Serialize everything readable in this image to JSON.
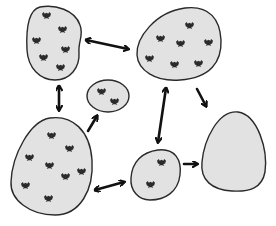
{
  "diagram": {
    "type": "metapopulation-patch-network",
    "colors": {
      "patch_fill": "#e2e2e2",
      "patch_stroke": "#2a2a2a",
      "arrow": "#111111",
      "bird": "#2b2b2b"
    },
    "patches": [
      {
        "id": "top-left",
        "bird_count": 6,
        "birds": [
          [
            46,
            15
          ],
          [
            62,
            29
          ],
          [
            36,
            40
          ],
          [
            65,
            49
          ],
          [
            43,
            57
          ],
          [
            60,
            67
          ]
        ]
      },
      {
        "id": "top-right",
        "bird_count": 7,
        "birds": [
          [
            189,
            25
          ],
          [
            160,
            38
          ],
          [
            180,
            43
          ],
          [
            208,
            42
          ],
          [
            149,
            58
          ],
          [
            174,
            64
          ],
          [
            198,
            63
          ]
        ]
      },
      {
        "id": "small-center",
        "bird_count": 2,
        "birds": [
          [
            101,
            91
          ],
          [
            114,
            101
          ]
        ]
      },
      {
        "id": "bottom-left",
        "bird_count": 8,
        "birds": [
          [
            51,
            135
          ],
          [
            69,
            148
          ],
          [
            29,
            157
          ],
          [
            49,
            165
          ],
          [
            81,
            171
          ],
          [
            65,
            176
          ],
          [
            25,
            185
          ],
          [
            48,
            198
          ]
        ]
      },
      {
        "id": "bottom-middle",
        "bird_count": 2,
        "birds": [
          [
            161,
            162
          ],
          [
            150,
            184
          ]
        ]
      },
      {
        "id": "bottom-right-empty",
        "bird_count": 0,
        "birds": []
      }
    ],
    "connections": [
      {
        "from": "top-left",
        "to": "top-right",
        "direction": "bidirectional"
      },
      {
        "from": "top-left",
        "to": "bottom-left",
        "direction": "bidirectional"
      },
      {
        "from": "bottom-left",
        "to": "small-center",
        "direction": "one-way"
      },
      {
        "from": "bottom-left",
        "to": "bottom-middle",
        "direction": "bidirectional"
      },
      {
        "from": "top-right",
        "to": "bottom-middle",
        "direction": "bidirectional"
      },
      {
        "from": "top-right",
        "to": "bottom-right-empty",
        "direction": "one-way"
      },
      {
        "from": "bottom-middle",
        "to": "bottom-right-empty",
        "direction": "one-way"
      }
    ]
  }
}
